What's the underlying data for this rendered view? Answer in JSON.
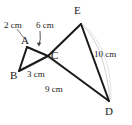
{
  "figure": {
    "type": "geometry-diagram",
    "stroke_color": "#1a1a1a",
    "arc_color": "#c9c9c9",
    "background": "#ffffff"
  },
  "vertices": [
    {
      "id": "A",
      "label": "A",
      "x": 27,
      "y": 47,
      "label_x": 21,
      "label_y": 35
    },
    {
      "id": "B",
      "label": "B",
      "x": 19,
      "y": 71,
      "label_x": 12,
      "label_y": 72
    },
    {
      "id": "C",
      "label": "C",
      "x": 48,
      "y": 56,
      "label_x": 51,
      "label_y": 51
    },
    {
      "id": "D",
      "label": "D",
      "x": 109,
      "y": 101,
      "label_x": 105,
      "label_y": 106
    },
    {
      "id": "E",
      "label": "E",
      "x": 81,
      "y": 24,
      "label_x": 75,
      "label_y": 7
    }
  ],
  "segments": [
    {
      "id": "AB",
      "from": "A",
      "to": "B"
    },
    {
      "id": "AC",
      "from": "A",
      "to": "C"
    },
    {
      "id": "BC",
      "from": "B",
      "to": "C"
    },
    {
      "id": "CE",
      "from": "C",
      "to": "E"
    },
    {
      "id": "CD",
      "from": "C",
      "to": "D"
    },
    {
      "id": "ED",
      "from": "E",
      "to": "D"
    }
  ],
  "measurements": [
    {
      "id": "AC",
      "text": "2 cm",
      "label_x": 4,
      "label_y": 24,
      "applies_to": "A-C"
    },
    {
      "id": "CE",
      "text": "6 cm",
      "label_x": 36,
      "label_y": 24,
      "applies_to": "C-E"
    },
    {
      "id": "BC",
      "text": "3 cm",
      "label_x": 27,
      "label_y": 72,
      "applies_to": "B-C"
    },
    {
      "id": "CD",
      "text": "9 cm",
      "label_x": 45,
      "label_y": 86,
      "applies_to": "C-D"
    },
    {
      "id": "ED",
      "text": "10 cm",
      "label_x": 96,
      "label_y": 52,
      "applies_to": "E-D"
    }
  ],
  "leader_arcs": [
    {
      "id": "arc-2cm",
      "for": "AC"
    },
    {
      "id": "arc-6cm",
      "for": "CE"
    },
    {
      "id": "arc-3cm",
      "for": "BC"
    },
    {
      "id": "arc-9cm",
      "for": "CD"
    },
    {
      "id": "arc-10cm",
      "for": "ED"
    }
  ]
}
